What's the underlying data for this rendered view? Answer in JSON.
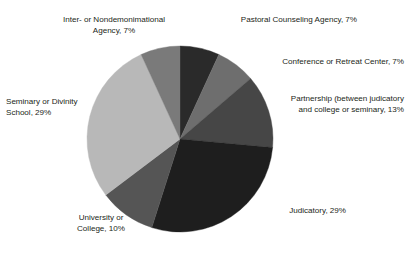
{
  "chart_data": {
    "type": "pie",
    "title": "",
    "subtitle": "",
    "xlabel": "",
    "ylabel": "",
    "legend_position": "none",
    "grid": false,
    "start_angle_deg": 0,
    "direction": "clockwise",
    "value_unit": "%",
    "categories": [
      "Pastoral Counseling Agency",
      "Conference or Retreat Center",
      "Partnership (between judicatory and college or seminary",
      "Judicatory",
      "University or College",
      "Seminary or Divinity School",
      "Inter- or Nondemonimational Agency"
    ],
    "values": [
      7,
      7,
      13,
      29,
      10,
      29,
      7
    ],
    "colors": [
      "#2a2a2a",
      "#6e6e6e",
      "#464646",
      "#1e1e1e",
      "#555555",
      "#b8b8b8",
      "#7a7a7a"
    ],
    "slices": [
      {
        "id": "pastoral-counseling-agency",
        "label": "Pastoral Counseling Agency, 7%",
        "name": "Pastoral Counseling Agency",
        "value": 7,
        "color": "#2a2a2a"
      },
      {
        "id": "conference-or-retreat-center",
        "label": "Conference or Retreat Center, 7%",
        "name": "Conference or Retreat Center",
        "value": 7,
        "color": "#6e6e6e"
      },
      {
        "id": "partnership",
        "label": "Partnership (between judicatory\nand college or seminary, 13%",
        "name": "Partnership (between judicatory and college or seminary",
        "value": 13,
        "color": "#464646"
      },
      {
        "id": "judicatory",
        "label": "Judicatory, 29%",
        "name": "Judicatory",
        "value": 29,
        "color": "#1e1e1e"
      },
      {
        "id": "university-or-college",
        "label": "University or\nCollege, 10%",
        "name": "University or College",
        "value": 10,
        "color": "#555555"
      },
      {
        "id": "seminary-or-divinity-school",
        "label": "Seminary or Divinity\nSchool, 29%",
        "name": "Seminary or Divinity School",
        "value": 29,
        "color": "#b8b8b8"
      },
      {
        "id": "inter-or-nondemonimational-agency",
        "label": "Inter- or Nondemonimational\nAgency, 7%",
        "name": "Inter- or Nondemonimational Agency",
        "value": 7,
        "color": "#7a7a7a"
      }
    ],
    "geometry": {
      "center_x": 180,
      "center_y": 139,
      "radius": 93
    }
  }
}
